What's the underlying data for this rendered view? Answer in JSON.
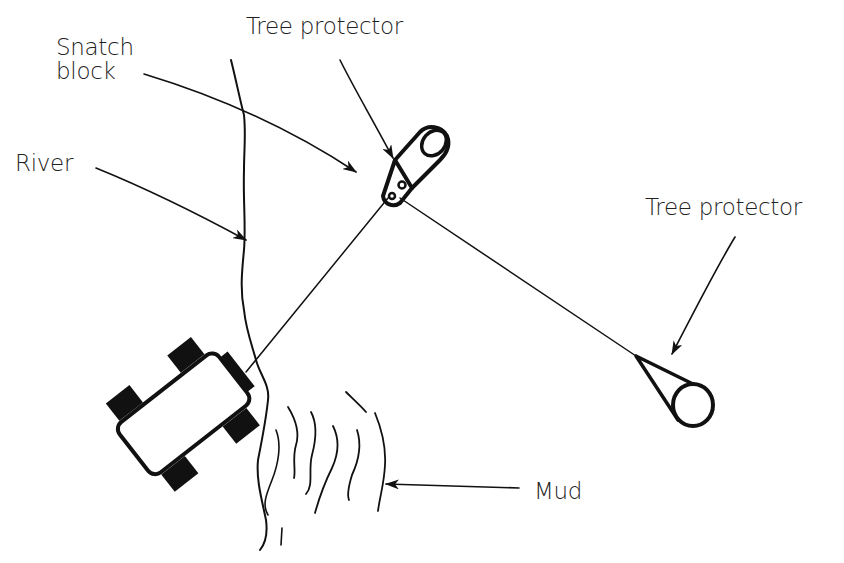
{
  "diagram": {
    "labels": {
      "snatch_block_line1": "Snatch",
      "snatch_block_line2": "block",
      "tree_protector_top": "Tree protector",
      "river": "River",
      "tree_protector_right": "Tree protector",
      "mud": "Mud"
    },
    "colors": {
      "ink": "#111111",
      "text": "#222222",
      "background": "#ffffff"
    }
  }
}
